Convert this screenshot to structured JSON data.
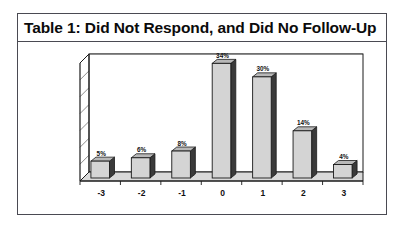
{
  "figure": {
    "title": "Table 1: Did Not Respond, and Did No Follow-Up",
    "border_color": "#4a4a52",
    "background": "#ffffff"
  },
  "chart_data": {
    "type": "bar",
    "title": "Table 1: Did Not Respond, and Did No Follow-Up",
    "xlabel": "",
    "ylabel": "",
    "categories": [
      "-3",
      "-2",
      "-1",
      "0",
      "1",
      "2",
      "3"
    ],
    "values": [
      5,
      6,
      8,
      34,
      30,
      14,
      4
    ],
    "value_labels": [
      "5%",
      "6%",
      "8%",
      "34%",
      "30%",
      "14%",
      "4%"
    ],
    "ylim": [
      0,
      35
    ],
    "y_tick_count": 7,
    "y_tick_labels": [],
    "grid": true,
    "legend": false,
    "legend_position": "none",
    "style": "3d-shadowed-columns",
    "bar_face_color": "#d4d4d4",
    "bar_side_color": "#3a3a3a",
    "bar_outline_color": "#1a1a1a",
    "grid_color": "#6e6e6e",
    "axis_color": "#1a1a1a"
  }
}
